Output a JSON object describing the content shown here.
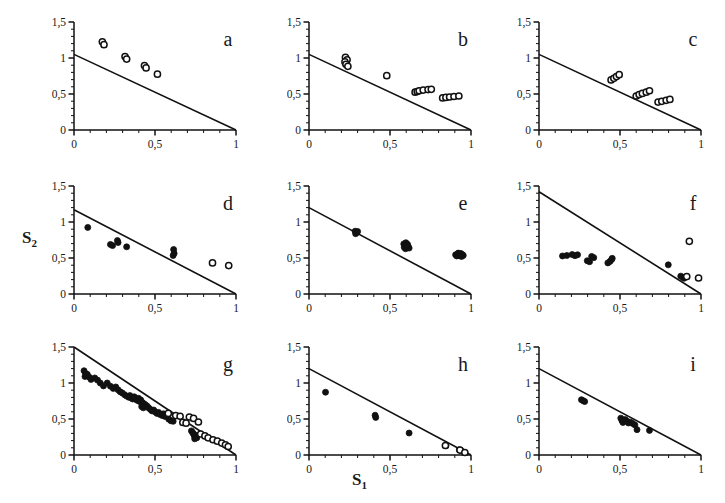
{
  "figure": {
    "background": "#ffffff",
    "ink_color": "#111111",
    "axis_label_x": "S",
    "axis_label_x_sub": "1",
    "axis_label_y": "S",
    "axis_label_y_sub": "2",
    "rows": 3,
    "cols": 3
  },
  "axes_common": {
    "xlim": [
      0,
      1
    ],
    "ylim": [
      0,
      1.5
    ],
    "xticks_major": [
      0,
      0.5,
      1
    ],
    "xticklabels": [
      "0",
      "0,5",
      "1"
    ],
    "yticks_major": [
      0,
      0.5,
      1,
      1.5
    ],
    "yticklabels": [
      "0",
      "0,5",
      "1",
      "1,5"
    ],
    "xticks_minor_step": 0.1,
    "yticks_minor_step": 0.1,
    "grid": false,
    "legend": "none"
  },
  "chart_data": [
    {
      "type": "scatter",
      "panel": "a",
      "title": "a",
      "xlabel": "S1",
      "ylabel": "S2",
      "xlim": [
        0,
        1
      ],
      "ylim": [
        0,
        1.5
      ],
      "xticklabels": [
        "0",
        "0,5",
        "1"
      ],
      "yticklabels": [
        "0",
        "0,5",
        "1",
        "1,5"
      ],
      "line": {
        "x0": 0.0,
        "y0": 1.05,
        "x1": 1.0,
        "y1": 0.0
      },
      "series": [
        {
          "name": "open",
          "marker": "open-circle",
          "points": [
            [
              0.175,
              1.225
            ],
            [
              0.185,
              1.185
            ],
            [
              0.315,
              1.02
            ],
            [
              0.325,
              0.985
            ],
            [
              0.435,
              0.895
            ],
            [
              0.445,
              0.862
            ],
            [
              0.515,
              0.775
            ]
          ]
        }
      ]
    },
    {
      "type": "scatter",
      "panel": "b",
      "title": "b",
      "xlabel": "S1",
      "ylabel": "S2",
      "xlim": [
        0,
        1
      ],
      "ylim": [
        0,
        1.5
      ],
      "xticklabels": [
        "0",
        "0,5",
        "1"
      ],
      "yticklabels": [
        "0",
        "0,5",
        "1",
        "1,5"
      ],
      "line": {
        "x0": 0.0,
        "y0": 1.05,
        "x1": 1.0,
        "y1": 0.0
      },
      "series": [
        {
          "name": "open",
          "marker": "open-circle",
          "points": [
            [
              0.225,
              1.01
            ],
            [
              0.235,
              0.975
            ],
            [
              0.222,
              0.945
            ],
            [
              0.228,
              0.912
            ],
            [
              0.24,
              0.885
            ],
            [
              0.48,
              0.755
            ],
            [
              0.655,
              0.525
            ],
            [
              0.668,
              0.535
            ],
            [
              0.68,
              0.545
            ],
            [
              0.705,
              0.555
            ],
            [
              0.735,
              0.562
            ],
            [
              0.755,
              0.565
            ],
            [
              0.825,
              0.445
            ],
            [
              0.845,
              0.452
            ],
            [
              0.868,
              0.458
            ],
            [
              0.895,
              0.465
            ],
            [
              0.925,
              0.472
            ]
          ]
        }
      ]
    },
    {
      "type": "scatter",
      "panel": "c",
      "title": "c",
      "xlabel": "S1",
      "ylabel": "S2",
      "xlim": [
        0,
        1
      ],
      "ylim": [
        0,
        1.5
      ],
      "xticklabels": [
        "0",
        "0,5",
        "1"
      ],
      "yticklabels": [
        "0",
        "0,5",
        "1",
        "1,5"
      ],
      "line": {
        "x0": 0.0,
        "y0": 1.05,
        "x1": 1.0,
        "y1": 0.0
      },
      "series": [
        {
          "name": "open",
          "marker": "open-circle",
          "points": [
            [
              0.445,
              0.695
            ],
            [
              0.462,
              0.718
            ],
            [
              0.478,
              0.742
            ],
            [
              0.495,
              0.768
            ],
            [
              0.6,
              0.472
            ],
            [
              0.618,
              0.492
            ],
            [
              0.638,
              0.508
            ],
            [
              0.662,
              0.525
            ],
            [
              0.682,
              0.545
            ],
            [
              0.735,
              0.388
            ],
            [
              0.758,
              0.398
            ],
            [
              0.785,
              0.412
            ],
            [
              0.808,
              0.425
            ]
          ]
        }
      ]
    },
    {
      "type": "scatter",
      "panel": "d",
      "title": "d",
      "xlabel": "S1",
      "ylabel": "S2",
      "xlim": [
        0,
        1
      ],
      "ylim": [
        0,
        1.5
      ],
      "xticklabels": [
        "0",
        "0,5",
        "1"
      ],
      "yticklabels": [
        "0",
        "0,5",
        "1",
        "1,5"
      ],
      "line": {
        "x0": 0.0,
        "y0": 1.17,
        "x1": 1.0,
        "y1": 0.0
      },
      "series": [
        {
          "name": "filled",
          "marker": "filled-circle",
          "points": [
            [
              0.085,
              0.925
            ],
            [
              0.225,
              0.688
            ],
            [
              0.238,
              0.672
            ],
            [
              0.268,
              0.742
            ],
            [
              0.272,
              0.715
            ],
            [
              0.325,
              0.655
            ],
            [
              0.615,
              0.618
            ],
            [
              0.618,
              0.565
            ],
            [
              0.612,
              0.535
            ]
          ]
        },
        {
          "name": "open",
          "marker": "open-circle",
          "points": [
            [
              0.855,
              0.432
            ],
            [
              0.955,
              0.395
            ]
          ]
        }
      ]
    },
    {
      "type": "scatter",
      "panel": "e",
      "title": "e",
      "xlabel": "S1",
      "ylabel": "S2",
      "xlim": [
        0,
        1
      ],
      "ylim": [
        0,
        1.5
      ],
      "xticklabels": [
        "0",
        "0,5",
        "1"
      ],
      "yticklabels": [
        "0",
        "0,5",
        "1",
        "1,5"
      ],
      "line": {
        "x0": 0.0,
        "y0": 1.2,
        "x1": 1.0,
        "y1": 0.0
      },
      "series": [
        {
          "name": "filled",
          "marker": "filled-circle",
          "points": [
            [
              0.285,
              0.872
            ],
            [
              0.295,
              0.855
            ],
            [
              0.288,
              0.838
            ],
            [
              0.3,
              0.868
            ],
            [
              0.585,
              0.695
            ],
            [
              0.598,
              0.712
            ],
            [
              0.608,
              0.69
            ],
            [
              0.612,
              0.662
            ],
            [
              0.592,
              0.668
            ],
            [
              0.602,
              0.645
            ],
            [
              0.618,
              0.638
            ],
            [
              0.588,
              0.648
            ],
            [
              0.605,
              0.672
            ],
            [
              0.596,
              0.628
            ],
            [
              0.905,
              0.545
            ],
            [
              0.918,
              0.558
            ],
            [
              0.928,
              0.548
            ],
            [
              0.938,
              0.562
            ],
            [
              0.948,
              0.545
            ],
            [
              0.912,
              0.528
            ],
            [
              0.932,
              0.53
            ],
            [
              0.952,
              0.535
            ],
            [
              0.922,
              0.568
            ],
            [
              0.942,
              0.522
            ]
          ]
        }
      ]
    },
    {
      "type": "scatter",
      "panel": "f",
      "title": "f",
      "xlabel": "S1",
      "ylabel": "S2",
      "xlim": [
        0,
        1
      ],
      "ylim": [
        0,
        1.5
      ],
      "xticklabels": [
        "0",
        "0,5",
        "1"
      ],
      "yticklabels": [
        "0",
        "0,5",
        "1",
        "1,5"
      ],
      "line": {
        "x0": 0.0,
        "y0": 1.42,
        "x1": 1.0,
        "y1": 0.0
      },
      "series": [
        {
          "name": "filled",
          "marker": "filled-circle",
          "points": [
            [
              0.145,
              0.528
            ],
            [
              0.172,
              0.535
            ],
            [
              0.205,
              0.548
            ],
            [
              0.222,
              0.532
            ],
            [
              0.238,
              0.545
            ],
            [
              0.298,
              0.462
            ],
            [
              0.312,
              0.448
            ],
            [
              0.325,
              0.522
            ],
            [
              0.338,
              0.505
            ],
            [
              0.425,
              0.432
            ],
            [
              0.438,
              0.452
            ],
            [
              0.452,
              0.495
            ],
            [
              0.448,
              0.478
            ],
            [
              0.798,
              0.405
            ],
            [
              0.875,
              0.248
            ],
            [
              0.888,
              0.232
            ],
            [
              0.895,
              0.218
            ]
          ]
        },
        {
          "name": "open",
          "marker": "open-circle",
          "points": [
            [
              0.928,
              0.732
            ],
            [
              0.912,
              0.242
            ],
            [
              0.985,
              0.222
            ]
          ]
        }
      ]
    },
    {
      "type": "scatter",
      "panel": "g",
      "title": "g",
      "xlabel": "S1",
      "ylabel": "S2",
      "xlim": [
        0,
        1
      ],
      "ylim": [
        0,
        1.5
      ],
      "xticklabels": [
        "0",
        "0,5",
        "1"
      ],
      "yticklabels": [
        "0",
        "0,5",
        "1",
        "1,5"
      ],
      "line": {
        "x0": 0.0,
        "y0": 1.5,
        "x1": 1.0,
        "y1": 0.0
      },
      "series": [
        {
          "name": "filled",
          "marker": "filled-circle",
          "points": [
            [
              0.062,
              1.17
            ],
            [
              0.072,
              1.13
            ],
            [
              0.068,
              1.09
            ],
            [
              0.082,
              1.12
            ],
            [
              0.095,
              1.08
            ],
            [
              0.105,
              1.05
            ],
            [
              0.128,
              1.07
            ],
            [
              0.145,
              1.04
            ],
            [
              0.162,
              1.0
            ],
            [
              0.182,
              0.96
            ],
            [
              0.205,
              1.0
            ],
            [
              0.225,
              0.955
            ],
            [
              0.242,
              0.925
            ],
            [
              0.258,
              0.945
            ],
            [
              0.272,
              0.905
            ],
            [
              0.285,
              0.878
            ],
            [
              0.298,
              0.862
            ],
            [
              0.312,
              0.838
            ],
            [
              0.325,
              0.818
            ],
            [
              0.338,
              0.802
            ],
            [
              0.345,
              0.825
            ],
            [
              0.352,
              0.795
            ],
            [
              0.362,
              0.778
            ],
            [
              0.372,
              0.808
            ],
            [
              0.382,
              0.772
            ],
            [
              0.392,
              0.758
            ],
            [
              0.398,
              0.788
            ],
            [
              0.405,
              0.742
            ],
            [
              0.412,
              0.765
            ],
            [
              0.422,
              0.728
            ],
            [
              0.432,
              0.712
            ],
            [
              0.442,
              0.695
            ],
            [
              0.418,
              0.672
            ],
            [
              0.428,
              0.655
            ],
            [
              0.452,
              0.678
            ],
            [
              0.462,
              0.652
            ],
            [
              0.472,
              0.632
            ],
            [
              0.482,
              0.612
            ],
            [
              0.492,
              0.625
            ],
            [
              0.502,
              0.598
            ],
            [
              0.512,
              0.578
            ],
            [
              0.522,
              0.592
            ],
            [
              0.532,
              0.562
            ],
            [
              0.545,
              0.548
            ],
            [
              0.552,
              0.572
            ],
            [
              0.562,
              0.535
            ],
            [
              0.585,
              0.498
            ],
            [
              0.598,
              0.475
            ],
            [
              0.612,
              0.468
            ],
            [
              0.725,
              0.335
            ],
            [
              0.732,
              0.312
            ],
            [
              0.738,
              0.292
            ],
            [
              0.742,
              0.272
            ],
            [
              0.748,
              0.252
            ],
            [
              0.752,
              0.275
            ],
            [
              0.758,
              0.238
            ],
            [
              0.745,
              0.225
            ]
          ]
        },
        {
          "name": "open",
          "marker": "open-circle",
          "points": [
            [
              0.582,
              0.578
            ],
            [
              0.628,
              0.548
            ],
            [
              0.655,
              0.538
            ],
            [
              0.672,
              0.452
            ],
            [
              0.692,
              0.442
            ],
            [
              0.712,
              0.528
            ],
            [
              0.738,
              0.508
            ],
            [
              0.768,
              0.458
            ],
            [
              0.782,
              0.292
            ],
            [
              0.808,
              0.265
            ],
            [
              0.828,
              0.238
            ],
            [
              0.858,
              0.212
            ],
            [
              0.885,
              0.192
            ],
            [
              0.912,
              0.165
            ],
            [
              0.935,
              0.142
            ],
            [
              0.952,
              0.118
            ]
          ]
        }
      ]
    },
    {
      "type": "scatter",
      "panel": "h",
      "title": "h",
      "xlabel": "S1",
      "ylabel": "S2",
      "xlim": [
        0,
        1
      ],
      "ylim": [
        0,
        1.5
      ],
      "xticklabels": [
        "0",
        "0,5",
        "1"
      ],
      "yticklabels": [
        "0",
        "0,5",
        "1",
        "1,5"
      ],
      "line": {
        "x0": 0.0,
        "y0": 1.2,
        "x1": 1.0,
        "y1": 0.0
      },
      "series": [
        {
          "name": "filled",
          "marker": "filled-circle",
          "points": [
            [
              0.102,
              0.872
            ],
            [
              0.408,
              0.552
            ],
            [
              0.412,
              0.522
            ],
            [
              0.618,
              0.305
            ],
            [
              0.845,
              0.128
            ],
            [
              0.928,
              0.072
            ],
            [
              0.938,
              0.062
            ]
          ]
        },
        {
          "name": "open",
          "marker": "open-circle",
          "points": [
            [
              0.842,
              0.132
            ],
            [
              0.932,
              0.068
            ],
            [
              0.962,
              0.035
            ]
          ]
        }
      ]
    },
    {
      "type": "scatter",
      "panel": "i",
      "title": "i",
      "xlabel": "S1",
      "ylabel": "S2",
      "xlim": [
        0,
        1
      ],
      "ylim": [
        0,
        1.5
      ],
      "xticklabels": [
        "0",
        "0,5",
        "1"
      ],
      "yticklabels": [
        "0",
        "0,5",
        "1",
        "1,5"
      ],
      "line": {
        "x0": 0.0,
        "y0": 1.2,
        "x1": 1.0,
        "y1": 0.0
      },
      "series": [
        {
          "name": "filled",
          "marker": "filled-circle",
          "points": [
            [
              0.262,
              0.768
            ],
            [
              0.272,
              0.755
            ],
            [
              0.282,
              0.742
            ],
            [
              0.505,
              0.512
            ],
            [
              0.512,
              0.478
            ],
            [
              0.518,
              0.452
            ],
            [
              0.532,
              0.492
            ],
            [
              0.545,
              0.468
            ],
            [
              0.552,
              0.445
            ],
            [
              0.565,
              0.455
            ],
            [
              0.578,
              0.438
            ],
            [
              0.592,
              0.418
            ],
            [
              0.605,
              0.352
            ],
            [
              0.682,
              0.342
            ]
          ]
        }
      ]
    }
  ]
}
